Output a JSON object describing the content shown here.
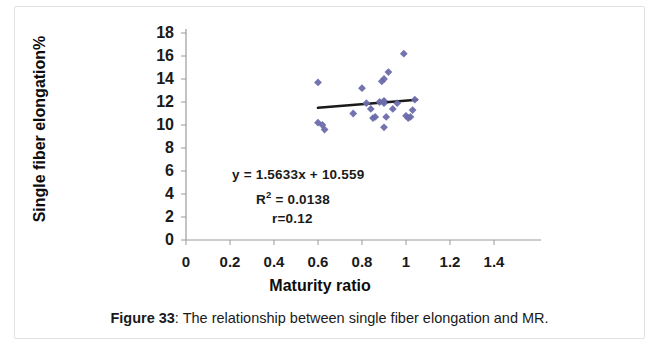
{
  "caption": {
    "label": "Figure 33",
    "separator": ":",
    "text": " The relationship between single fiber elongation and MR."
  },
  "annotations": {
    "equation": "y = 1.5633x + 10.559",
    "r_squared_prefix": "R",
    "r_squared_exponent": "2",
    "r_squared_value": " = 0.0138",
    "correlation": "r=0.12"
  },
  "colors": {
    "marker": "#6b6bab",
    "trendline": "#1a1a1a",
    "axis": "#9a9a9a",
    "text": "#1a1a1a"
  },
  "chart_data": {
    "type": "scatter",
    "title": "",
    "xlabel": "Maturity ratio",
    "ylabel": "Single fiber elongation%",
    "xlim": [
      0,
      1.5
    ],
    "ylim": [
      0,
      18
    ],
    "xticks": [
      0,
      0.2,
      0.4,
      0.6,
      0.8,
      1,
      1.2,
      1.4
    ],
    "xticklabels": [
      "0",
      "0.2",
      "0.4",
      "0.6",
      "0.8",
      "1",
      "1.2",
      "1.4"
    ],
    "yticks": [
      0,
      2,
      4,
      6,
      8,
      10,
      12,
      14,
      16,
      18
    ],
    "yticklabels": [
      "0",
      "2",
      "4",
      "6",
      "8",
      "10",
      "12",
      "14",
      "16",
      "18"
    ],
    "grid": false,
    "legend": false,
    "marker_shape": "diamond",
    "points": [
      {
        "x": 0.6,
        "y": 13.7
      },
      {
        "x": 0.6,
        "y": 10.2
      },
      {
        "x": 0.62,
        "y": 10.0
      },
      {
        "x": 0.63,
        "y": 9.6
      },
      {
        "x": 0.76,
        "y": 11.0
      },
      {
        "x": 0.8,
        "y": 13.2
      },
      {
        "x": 0.82,
        "y": 11.9
      },
      {
        "x": 0.84,
        "y": 11.4
      },
      {
        "x": 0.85,
        "y": 10.6
      },
      {
        "x": 0.86,
        "y": 10.7
      },
      {
        "x": 0.88,
        "y": 12.0
      },
      {
        "x": 0.89,
        "y": 13.8
      },
      {
        "x": 0.9,
        "y": 14.0
      },
      {
        "x": 0.9,
        "y": 12.1
      },
      {
        "x": 0.9,
        "y": 11.9
      },
      {
        "x": 0.9,
        "y": 9.8
      },
      {
        "x": 0.91,
        "y": 10.7
      },
      {
        "x": 0.92,
        "y": 14.6
      },
      {
        "x": 0.94,
        "y": 11.4
      },
      {
        "x": 0.96,
        "y": 11.9
      },
      {
        "x": 0.99,
        "y": 16.2
      },
      {
        "x": 1.0,
        "y": 10.8
      },
      {
        "x": 1.01,
        "y": 10.6
      },
      {
        "x": 1.02,
        "y": 10.7
      },
      {
        "x": 1.03,
        "y": 11.3
      },
      {
        "x": 1.04,
        "y": 12.2
      }
    ],
    "trendline": {
      "slope": 1.5633,
      "intercept": 10.559,
      "x_start": 0.6,
      "x_end": 1.05,
      "r_squared": 0.0138,
      "r": 0.12
    }
  }
}
